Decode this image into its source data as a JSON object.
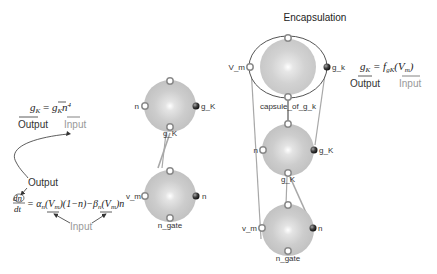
{
  "title": "Encapsulation",
  "equations": {
    "left_gk": {
      "lhs": "g",
      "lhs_sub": "K",
      "eq": " = ",
      "rhs": "g",
      "rhs_sub": "K",
      "rhs_tail": "n",
      "rhs_sup": "4"
    },
    "left_gk_output": "Output",
    "left_gk_input": "Input",
    "ode_output": "Output",
    "ode": {
      "lhs_num": "dn",
      "lhs_den": "dt",
      "rhs": "= α",
      "rhs_1": "n",
      "rhs_2": "(V",
      "rhs_3": "m",
      "rhs_4": ")(1−n)−β",
      "rhs_5": "n",
      "rhs_6": "(V",
      "rhs_7": "m",
      "rhs_8": ")n"
    },
    "ode_input": "Input",
    "right_gk": {
      "lhs": "g",
      "lhs_sub": "K",
      "eq": " = f",
      "f_sub": "gK",
      "tail": "(V",
      "tail_sub": "m",
      "close": ")"
    },
    "right_output": "Output",
    "right_input": "Input"
  },
  "modules_middle": [
    {
      "name": "g_K module",
      "ports": {
        "left": "n",
        "right": "g_K",
        "bottom": "g_K"
      }
    },
    {
      "name": "n_gate module",
      "ports": {
        "left": "v_m",
        "right": "n",
        "bottom": "n_gate"
      }
    }
  ],
  "capsule": {
    "label": "capsule_of_g_k",
    "ports": {
      "left": "V_m",
      "right": "g_k"
    },
    "inner": [
      {
        "name": "g_K module",
        "ports": {
          "left": "n",
          "right": "g_K",
          "bottom": "g_K"
        }
      },
      {
        "name": "n_gate module",
        "ports": {
          "left": "v_m",
          "right": "n",
          "bottom": "n_gate"
        }
      }
    ]
  },
  "colors": {
    "sphere": "#c8c8c8",
    "sphere_highlight": "#f4f4f4",
    "port_ring": "#8a8a8a",
    "port_dark": "#333333",
    "wire": "#a8a8a8",
    "capsule_outline": "#555555"
  }
}
